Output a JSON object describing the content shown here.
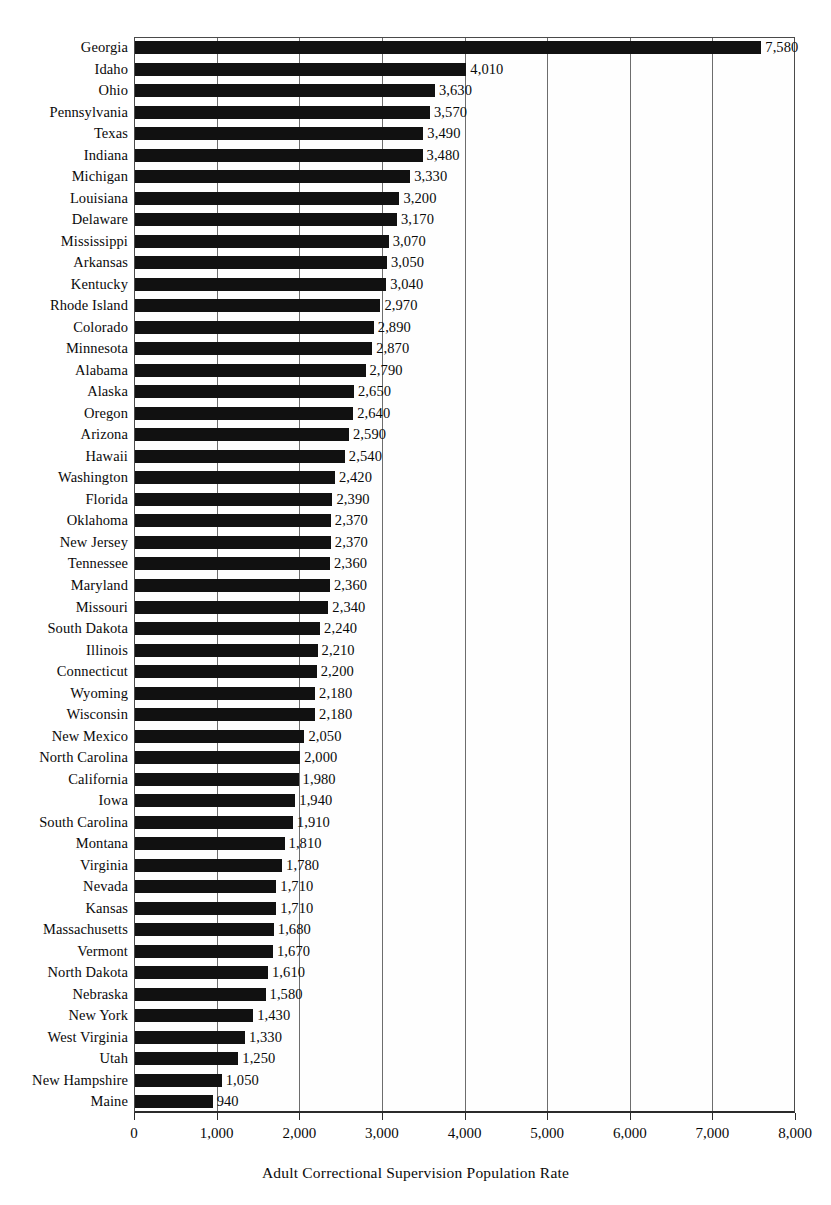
{
  "chart_data": {
    "type": "bar",
    "orientation": "horizontal",
    "title": "",
    "xlabel": "Adult Correctional Supervision Population Rate",
    "ylabel": "",
    "xlim": [
      0,
      8000
    ],
    "xticks": [
      0,
      1000,
      2000,
      3000,
      4000,
      5000,
      6000,
      7000,
      8000
    ],
    "xtick_labels": [
      "0",
      "1,000",
      "2,000",
      "3,000",
      "4,000",
      "5,000",
      "6,000",
      "7,000",
      "8,000"
    ],
    "grid": "vertical",
    "legend": "none",
    "bar_color": "#111111",
    "categories": [
      "Georgia",
      "Idaho",
      "Ohio",
      "Pennsylvania",
      "Texas",
      "Indiana",
      "Michigan",
      "Louisiana",
      "Delaware",
      "Mississippi",
      "Arkansas",
      "Kentucky",
      "Rhode Island",
      "Colorado",
      "Minnesota",
      "Alabama",
      "Alaska",
      "Oregon",
      "Arizona",
      "Hawaii",
      "Washington",
      "Florida",
      "Oklahoma",
      "New Jersey",
      "Tennessee",
      "Maryland",
      "Missouri",
      "South Dakota",
      "Illinois",
      "Connecticut",
      "Wyoming",
      "Wisconsin",
      "New Mexico",
      "North Carolina",
      "California",
      "Iowa",
      "South Carolina",
      "Montana",
      "Virginia",
      "Nevada",
      "Kansas",
      "Massachusetts",
      "Vermont",
      "North Dakota",
      "Nebraska",
      "New York",
      "West Virginia",
      "Utah",
      "New Hampshire",
      "Maine"
    ],
    "values": [
      7580,
      4010,
      3630,
      3570,
      3490,
      3480,
      3330,
      3200,
      3170,
      3070,
      3050,
      3040,
      2970,
      2890,
      2870,
      2790,
      2650,
      2640,
      2590,
      2540,
      2420,
      2390,
      2370,
      2370,
      2360,
      2360,
      2340,
      2240,
      2210,
      2200,
      2180,
      2180,
      2050,
      2000,
      1980,
      1940,
      1910,
      1810,
      1780,
      1710,
      1710,
      1680,
      1670,
      1610,
      1580,
      1430,
      1330,
      1250,
      1050,
      940
    ],
    "value_labels": [
      "7,580",
      "4,010",
      "3,630",
      "3,570",
      "3,490",
      "3,480",
      "3,330",
      "3,200",
      "3,170",
      "3,070",
      "3,050",
      "3,040",
      "2,970",
      "2,890",
      "2,870",
      "2,790",
      "2,650",
      "2,640",
      "2,590",
      "2,540",
      "2,420",
      "2,390",
      "2,370",
      "2,370",
      "2,360",
      "2,360",
      "2,340",
      "2,240",
      "2,210",
      "2,200",
      "2,180",
      "2,180",
      "2,050",
      "2,000",
      "1,980",
      "1,940",
      "1,910",
      "1,810",
      "1,780",
      "1,710",
      "1,710",
      "1,680",
      "1,670",
      "1,610",
      "1,580",
      "1,430",
      "1,330",
      "1,250",
      "1,050",
      "940"
    ]
  }
}
